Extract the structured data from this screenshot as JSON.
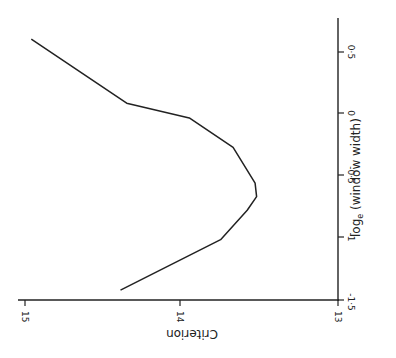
{
  "chart_data": {
    "type": "line",
    "orientation": "rotated 90 degrees (figure printed sideways)",
    "title": "",
    "xlabel": "log_e (window width)",
    "ylabel": "Criterion",
    "xlim": [
      -1.5,
      0.7
    ],
    "ylim": [
      13,
      15
    ],
    "x_ticks": [
      "-1.5",
      "-1",
      "-0.5",
      "0",
      "0.5"
    ],
    "y_ticks": [
      "13",
      "14",
      "15"
    ],
    "grid": false,
    "legend": null,
    "series": [
      {
        "name": "Criterion",
        "x": [
          -1.44,
          -1.03,
          -0.79,
          -0.68,
          -0.57,
          -0.28,
          -0.04,
          0.08,
          0.6
        ],
        "y": [
          14.39,
          13.75,
          13.58,
          13.52,
          13.53,
          13.67,
          13.95,
          14.35,
          14.96
        ]
      }
    ]
  },
  "labels": {
    "x_axis_title_main": "log",
    "x_axis_title_sub": "e",
    "x_axis_title_rest": " (window width)",
    "y_axis_title": "Criterion",
    "x_ticks": [
      "0·5",
      "0",
      "-0·5",
      "-1",
      "-1·5"
    ],
    "y_ticks": [
      "15",
      "14",
      "13"
    ]
  }
}
